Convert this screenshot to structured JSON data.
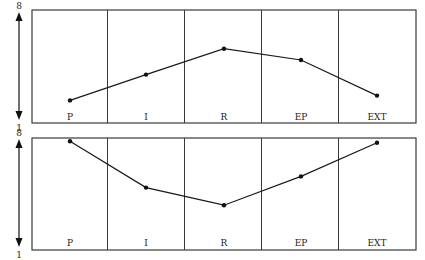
{
  "chart_data": [
    {
      "type": "line",
      "panel": "top",
      "title": "",
      "xlabel": "",
      "ylabel": "",
      "categories": [
        "P",
        "I",
        "R",
        "EP",
        "EXT"
      ],
      "values": [
        2.4,
        4.0,
        5.6,
        4.9,
        2.7
      ],
      "ylim": [
        1,
        8
      ],
      "y_ticks": [
        "8",
        "1"
      ],
      "y_axis": "double-headed arrow",
      "grid": "vertical dividers between categories",
      "legend": "none"
    },
    {
      "type": "line",
      "panel": "bottom",
      "title": "",
      "xlabel": "",
      "ylabel": "",
      "categories": [
        "P",
        "I",
        "R",
        "EP",
        "EXT"
      ],
      "values": [
        7.8,
        4.9,
        3.8,
        5.6,
        7.7
      ],
      "ylim": [
        1,
        8
      ],
      "y_ticks": [
        "8",
        "1"
      ],
      "y_axis": "double-headed arrow",
      "grid": "vertical dividers between categories",
      "legend": "none"
    }
  ],
  "panels": [
    {
      "y_top_label": "8",
      "y_bottom_label": "1",
      "categories": [
        "P",
        "I",
        "R",
        "EP",
        "EXT"
      ]
    },
    {
      "y_top_label": "8",
      "y_bottom_label": "1",
      "categories": [
        "P",
        "I",
        "R",
        "EP",
        "EXT"
      ]
    }
  ],
  "colors": {
    "line": "#1a1a1a",
    "frame": "#3a3a3a",
    "background": "#ffffff"
  }
}
